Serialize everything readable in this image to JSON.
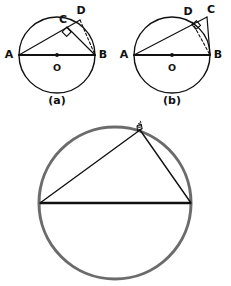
{
  "figure": {
    "background_color": "#ffffff",
    "ink_color": "#111111",
    "circle_gray": "#6b6b6b",
    "panels": [
      {
        "id": "panel-a",
        "caption": "(a)",
        "caption_pos": {
          "x": 57,
          "y": 101
        },
        "circle": {
          "cx": 57,
          "cy": 55,
          "r": 38,
          "stroke": "#111111",
          "stroke_width": 1.4
        },
        "center_dot": {
          "cx": 57,
          "cy": 55,
          "r": 1.9
        },
        "points": [
          {
            "name": "A",
            "x": 19,
            "y": 55,
            "label": "A",
            "label_x": 9,
            "label_y": 55,
            "on_circle": true
          },
          {
            "name": "B",
            "x": 95,
            "y": 55,
            "label": "B",
            "label_x": 103,
            "label_y": 55,
            "on_circle": true
          },
          {
            "name": "O",
            "x": 57,
            "y": 55,
            "label": "O",
            "label_x": 57,
            "label_y": 68,
            "on_circle": false
          },
          {
            "name": "C",
            "x": 67,
            "y": 27,
            "label": "C",
            "label_x": 63,
            "label_y": 20,
            "on_circle": false
          },
          {
            "name": "D",
            "x": 80,
            "y": 20,
            "label": "D",
            "label_x": 80,
            "label_y": 11,
            "on_circle": true
          }
        ],
        "segments": [
          {
            "from": "A",
            "to": "B",
            "style": "solid",
            "width": 2.0
          },
          {
            "from": "A",
            "to": "D",
            "style": "solid",
            "width": 1.2
          },
          {
            "from": "C",
            "to": "B",
            "style": "solid",
            "width": 1.2
          },
          {
            "from": "D",
            "to": "B",
            "style": "dashed",
            "width": 1.1
          }
        ],
        "right_angle_at": "C",
        "right_angle_note": "square marker at C between CA and CB",
        "c_inside_circle": true
      },
      {
        "id": "panel-b",
        "caption": "(b)",
        "caption_pos": {
          "x": 172,
          "y": 101
        },
        "circle": {
          "cx": 172,
          "cy": 55,
          "r": 38,
          "stroke": "#111111",
          "stroke_width": 1.4
        },
        "center_dot": {
          "cx": 172,
          "cy": 55,
          "r": 1.9
        },
        "points": [
          {
            "name": "A",
            "x": 134,
            "y": 55,
            "label": "A",
            "label_x": 124,
            "label_y": 55,
            "on_circle": true
          },
          {
            "name": "B",
            "x": 210,
            "y": 55,
            "label": "B",
            "label_x": 218,
            "label_y": 55,
            "on_circle": true
          },
          {
            "name": "O",
            "x": 172,
            "y": 55,
            "label": "O",
            "label_x": 172,
            "label_y": 68,
            "on_circle": false
          },
          {
            "name": "D",
            "x": 192,
            "y": 22,
            "label": "D",
            "label_x": 188,
            "label_y": 12,
            "on_circle": true
          },
          {
            "name": "C",
            "x": 207,
            "y": 17,
            "label": "C",
            "label_x": 210,
            "label_y": 10,
            "on_circle": false
          }
        ],
        "segments": [
          {
            "from": "A",
            "to": "B",
            "style": "solid",
            "width": 2.0
          },
          {
            "from": "A",
            "to": "C",
            "style": "solid",
            "width": 1.2
          },
          {
            "from": "C",
            "to": "B",
            "style": "solid",
            "width": 1.2
          },
          {
            "from": "D",
            "to": "B",
            "style": "dashed",
            "width": 1.1
          }
        ],
        "right_angle_at": "D",
        "right_angle_note": "square marker at D between DA and DB",
        "c_inside_circle": false
      }
    ],
    "main_diagram": {
      "id": "panel-main",
      "circle": {
        "cx": 115,
        "cy": 203,
        "r": 76,
        "stroke": "#6b6b6b",
        "stroke_width": 3.0
      },
      "points": [
        {
          "name": "left",
          "x": 40,
          "y": 203
        },
        {
          "name": "right",
          "x": 191,
          "y": 203
        },
        {
          "name": "apex",
          "x": 140,
          "y": 130
        }
      ],
      "segments": [
        {
          "from": "left",
          "to": "right",
          "style": "solid",
          "width": 2.6
        },
        {
          "from": "left",
          "to": "apex",
          "style": "solid",
          "width": 1.4
        },
        {
          "from": "apex",
          "to": "right",
          "style": "solid",
          "width": 1.4
        }
      ],
      "apex_mark": {
        "note": "small scribbled right-angle mark at apex",
        "x": 140,
        "y": 130
      }
    }
  }
}
